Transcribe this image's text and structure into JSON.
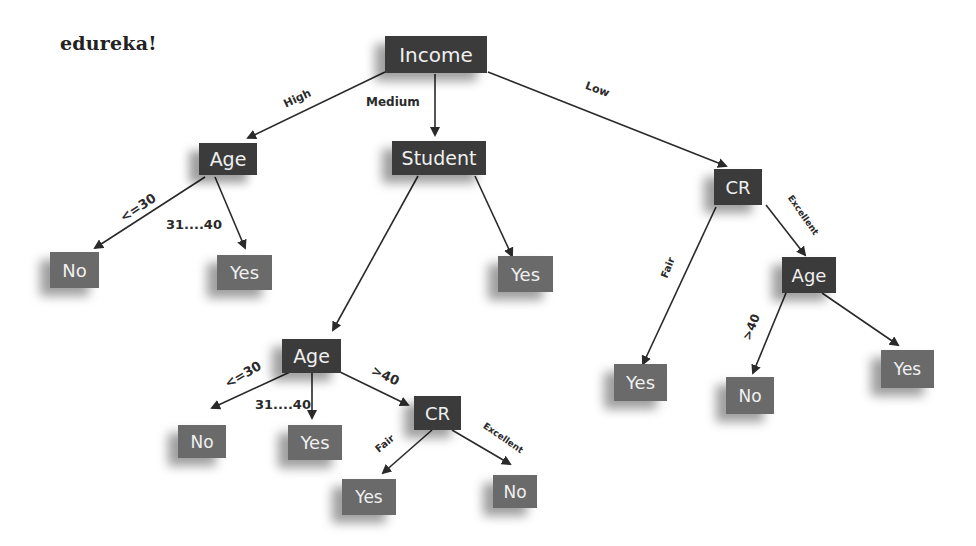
{
  "brand": "edureka!",
  "colors": {
    "decision_node": "#3b3b3b",
    "leaf_node": "#6a6a6a",
    "edge": "#2a2a2a",
    "node_text": "#f0f0f0",
    "background": "#ffffff"
  },
  "nodes": {
    "income": {
      "label": "Income",
      "type": "decision"
    },
    "age1": {
      "label": "Age",
      "type": "decision"
    },
    "student": {
      "label": "Student",
      "type": "decision"
    },
    "cr1": {
      "label": "CR",
      "type": "decision"
    },
    "no1": {
      "label": "No",
      "type": "leaf"
    },
    "yes1": {
      "label": "Yes",
      "type": "leaf"
    },
    "yes2": {
      "label": "Yes",
      "type": "leaf"
    },
    "age2": {
      "label": "Age",
      "type": "decision"
    },
    "no2": {
      "label": "No",
      "type": "leaf"
    },
    "yes3": {
      "label": "Yes",
      "type": "leaf"
    },
    "cr2": {
      "label": "CR",
      "type": "decision"
    },
    "yes4": {
      "label": "Yes",
      "type": "leaf"
    },
    "no3": {
      "label": "No",
      "type": "leaf"
    },
    "yes5": {
      "label": "Yes",
      "type": "leaf"
    },
    "age3": {
      "label": "Age",
      "type": "decision"
    },
    "no4": {
      "label": "No",
      "type": "leaf"
    },
    "yes6": {
      "label": "Yes",
      "type": "leaf"
    }
  },
  "edges": {
    "income_age1": {
      "label": "High"
    },
    "income_student": {
      "label": "Medium"
    },
    "income_cr1": {
      "label": "Low"
    },
    "age1_no1": {
      "label": "<=30"
    },
    "age1_yes1": {
      "label": "31....40"
    },
    "student_age2": {
      "label": ""
    },
    "student_yes2": {
      "label": ""
    },
    "age2_no2": {
      "label": "<=30"
    },
    "age2_yes3": {
      "label": "31....40"
    },
    "age2_cr2": {
      "label": ">40"
    },
    "cr2_yes4": {
      "label": "Fair"
    },
    "cr2_no3": {
      "label": "Excellent"
    },
    "cr1_yes5": {
      "label": "Fair"
    },
    "cr1_age3": {
      "label": "Excellent"
    },
    "age3_no4": {
      "label": ">40"
    },
    "age3_yes6": {
      "label": ""
    }
  }
}
